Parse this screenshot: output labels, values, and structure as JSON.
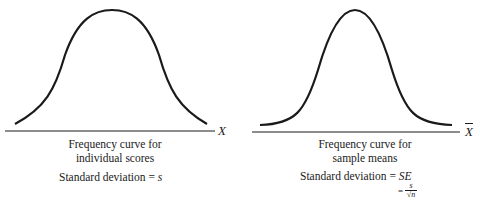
{
  "left_panel": {
    "axis_label": "X",
    "caption_line1": "Frequency curve for",
    "caption_line2": "individual scores",
    "sd_text": "Standard deviation = ",
    "sd_symbol": "s"
  },
  "right_panel": {
    "axis_label": "X",
    "axis_label_overline": true,
    "caption_line1": "Frequency curve for",
    "caption_line2": "sample means",
    "sd_text": "Standard deviation = ",
    "sd_symbol": "SE",
    "sd_eq2_prefix": "= ",
    "sd_eq2_numerator": "s",
    "sd_eq2_denominator": "√n"
  },
  "colors": {
    "stroke": "#1a1a1a",
    "background": "#ffffff"
  }
}
